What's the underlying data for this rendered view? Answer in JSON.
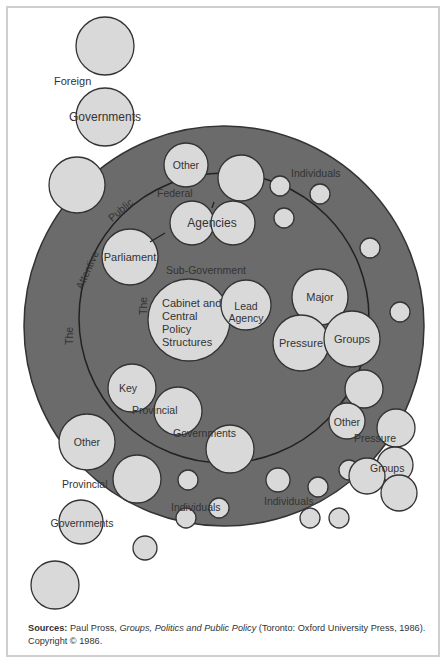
{
  "diagram": {
    "colors": {
      "outer_ring": "#6b6b6b",
      "bubble_fill": "#d9d9d9",
      "stroke": "#333333",
      "text": "#333333",
      "background": "#ffffff"
    },
    "rings": [
      {
        "name": "attentive-public",
        "cx": 224,
        "cy": 326,
        "r": 200
      },
      {
        "name": "sub-government",
        "cx": 224,
        "cy": 318,
        "r": 145
      }
    ],
    "labels": {
      "foreign": "Foreign",
      "foreign_governments": "Governments",
      "other_federal": "Other",
      "federal": "Federal",
      "agencies": "Agencies",
      "individuals_top": "Individuals",
      "the_outer": "The",
      "attentive": "Attentive",
      "public": "Public",
      "parliament": "Parliament",
      "sub_government": "Sub-Government",
      "the_inner": "The",
      "cabinet_line1": "Cabinet and",
      "cabinet_line2": "Central",
      "cabinet_line3": "Policy",
      "cabinet_line4": "Structures",
      "lead_line1": "Lead",
      "lead_line2": "Agency",
      "major": "Major",
      "pressure_inner": "Pressure",
      "groups_inner": "Groups",
      "key": "Key",
      "provincial_inner": "Provincial",
      "governments_inner": "Governments",
      "other_provincial": "Other",
      "provincial_outer": "Provincial",
      "governments_outer": "Governments",
      "individuals_left": "Individuals",
      "individuals_right": "Individuals",
      "other_pressure": "Other",
      "pressure_outer": "Pressure",
      "groups_outer": "Groups"
    }
  },
  "caption": {
    "sources_label": "Sources:",
    "author": "Paul Pross, ",
    "book_title": "Groups, Politics and Public Policy",
    "publisher": " (Toronto: Oxford University Press, 1986).",
    "copyright": "Copyright © 1986."
  }
}
